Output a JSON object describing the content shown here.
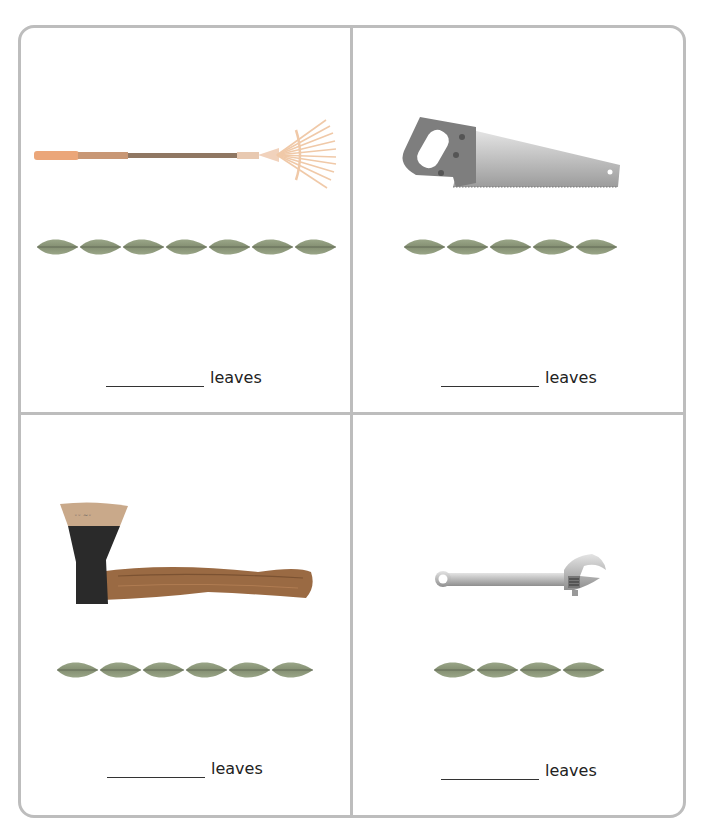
{
  "worksheet": {
    "panels": [
      {
        "id": "rake",
        "tool_name": "rake",
        "tool_icon": "rake-icon",
        "leaf_count": 7,
        "answer_blank": "",
        "unit_label": "leaves"
      },
      {
        "id": "saw",
        "tool_name": "saw",
        "tool_icon": "saw-icon",
        "leaf_count": 5,
        "answer_blank": "",
        "unit_label": "leaves"
      },
      {
        "id": "axe",
        "tool_name": "axe",
        "tool_icon": "axe-icon",
        "leaf_count": 6,
        "answer_blank": "",
        "unit_label": "leaves"
      },
      {
        "id": "wrench",
        "tool_name": "wrench",
        "tool_icon": "wrench-icon",
        "leaf_count": 4,
        "answer_blank": "",
        "unit_label": "leaves"
      }
    ]
  },
  "colors": {
    "border": "#bdbdbd",
    "leaf": "#8e9a7c",
    "leaf_vein": "#5b6350",
    "text": "#222222"
  }
}
